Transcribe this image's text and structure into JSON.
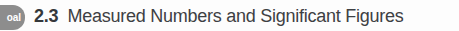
{
  "page": {
    "background_color": "#fdfdfd"
  },
  "goal_badge": {
    "label": "oal",
    "full_label": "Goal",
    "background_color": "#8d8d8d",
    "text_color": "#ffffff"
  },
  "heading": {
    "number": "2.3",
    "title": "Measured Numbers and Significant Figures",
    "number_color": "#35383b",
    "title_color": "#3d4043"
  }
}
